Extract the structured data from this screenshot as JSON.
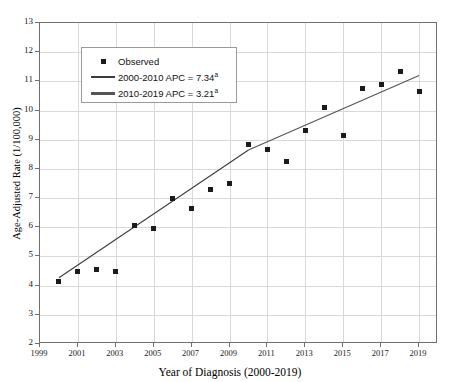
{
  "chart_data": {
    "type": "scatter",
    "title": "",
    "xlabel": "Year of Diagnosis (2000-2019)",
    "ylabel": "Age-Adjusted Rate (1/100,000)",
    "xlim": [
      1999,
      2020
    ],
    "ylim": [
      2,
      13
    ],
    "grid": true,
    "legend_position": "top-left",
    "x": [
      2000,
      2001,
      2002,
      2003,
      2004,
      2005,
      2006,
      2007,
      2008,
      2009,
      2010,
      2011,
      2012,
      2013,
      2014,
      2015,
      2016,
      2017,
      2018,
      2019
    ],
    "xtick_labels": [
      "1999",
      "2001",
      "2003",
      "2005",
      "2007",
      "2009",
      "2011",
      "2013",
      "2015",
      "2017",
      "2019"
    ],
    "xtick_values": [
      1999,
      2001,
      2003,
      2005,
      2007,
      2009,
      2011,
      2013,
      2015,
      2017,
      2019
    ],
    "ytick_labels": [
      "2",
      "3",
      "4",
      "5",
      "6",
      "7",
      "8",
      "9",
      "10",
      "11",
      "12",
      "13"
    ],
    "ytick_values": [
      2,
      3,
      4,
      5,
      6,
      7,
      8,
      9,
      10,
      11,
      12,
      13
    ],
    "series": [
      {
        "name": "Observed",
        "type": "scatter",
        "marker": "square",
        "color": "#1b1b1b",
        "values": [
          4.15,
          4.5,
          4.55,
          4.5,
          6.05,
          5.95,
          7.0,
          6.65,
          7.3,
          7.5,
          8.85,
          8.65,
          8.25,
          9.3,
          10.1,
          9.15,
          10.75,
          10.9,
          11.35,
          10.65
        ]
      },
      {
        "name": "2000-2010 APC = 7.34",
        "type": "line",
        "color": "#3c3c3c",
        "segment_x": [
          2000,
          2010
        ],
        "segment_y": [
          4.27,
          8.65
        ],
        "apc": 7.34,
        "footnote": "a"
      },
      {
        "name": "2010-2019 APC = 3.21",
        "type": "line",
        "color": "#545454",
        "segment_x": [
          2010,
          2019
        ],
        "segment_y": [
          8.65,
          11.2
        ],
        "apc": 3.21,
        "footnote": "a"
      }
    ]
  },
  "legend": {
    "items": [
      {
        "key": "square",
        "label": "Observed",
        "sup": ""
      },
      {
        "key": "line",
        "label": "2000-2010 APC  = 7.34",
        "sup": "a"
      },
      {
        "key": "line-thick",
        "label": "2010-2019 APC  = 3.21",
        "sup": "a"
      }
    ]
  },
  "axes": {
    "x_title": "Year of Diagnosis (2000-2019)",
    "y_title": "Age-Adjusted Rate (1/100,000)"
  }
}
